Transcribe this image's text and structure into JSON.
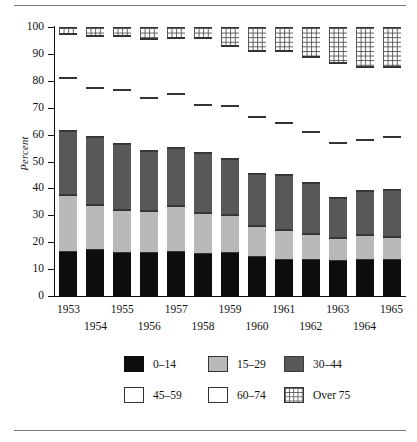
{
  "figure": {
    "ylabel": "Percent",
    "has_top_rule": true,
    "has_bottom_rule": true
  },
  "chart_data": {
    "type": "bar",
    "stacked": true,
    "title": "",
    "xlabel": "",
    "ylabel": "Percent",
    "ylim": [
      0,
      100
    ],
    "yticks": [
      0,
      10,
      20,
      30,
      40,
      50,
      60,
      70,
      80,
      90,
      100
    ],
    "grid": false,
    "legend_position": "bottom",
    "categories": [
      "1953",
      "1954",
      "1955",
      "1956",
      "1957",
      "1958",
      "1959",
      "1960",
      "1961",
      "1962",
      "1963",
      "1964",
      "1965"
    ],
    "series": [
      {
        "name": "0–14",
        "color": "#0d0d0d",
        "values": [
          16.5,
          17.0,
          16.0,
          16.0,
          16.5,
          15.5,
          16.0,
          14.5,
          13.5,
          13.5,
          13.0,
          13.5,
          13.5
        ]
      },
      {
        "name": "15–29",
        "color": "#b9b9b9",
        "values": [
          21.0,
          17.0,
          16.0,
          15.5,
          17.0,
          15.5,
          14.0,
          11.5,
          11.0,
          9.5,
          8.5,
          9.0,
          8.5
        ]
      },
      {
        "name": "30–44",
        "color": "#585858",
        "values": [
          24.0,
          25.0,
          24.5,
          22.5,
          21.5,
          22.0,
          21.0,
          19.5,
          20.5,
          19.0,
          15.0,
          16.5,
          17.5
        ]
      },
      {
        "name": "45–59",
        "color": "#ffffff",
        "values": [
          19.5,
          18.5,
          20.0,
          19.5,
          20.0,
          18.0,
          19.5,
          21.0,
          19.5,
          19.0,
          20.5,
          19.0,
          19.5
        ]
      },
      {
        "name": "60–74",
        "color": "#ffffff",
        "values": [
          16.5,
          19.0,
          20.0,
          22.0,
          21.0,
          25.0,
          22.5,
          24.5,
          26.5,
          28.0,
          29.5,
          27.0,
          26.0
        ]
      },
      {
        "name": "Over 75",
        "color": "#ffffff",
        "values": [
          2.5,
          3.5,
          3.5,
          4.5,
          4.0,
          4.0,
          7.0,
          9.0,
          9.0,
          11.0,
          13.5,
          15.0,
          15.0
        ]
      }
    ],
    "legend_entries": [
      "0–14",
      "15–29",
      "30–44",
      "45–59",
      "60–74",
      "Over 75"
    ]
  }
}
